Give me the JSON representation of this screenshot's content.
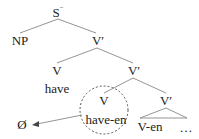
{
  "tree": {
    "root": {
      "label": "S",
      "superscript": "−"
    },
    "np": {
      "label": "NP"
    },
    "vbar1": {
      "label": "V′"
    },
    "v1": {
      "label": "V"
    },
    "vbar2": {
      "label": "V′"
    },
    "have": {
      "label": "have"
    },
    "v2": {
      "label": "V"
    },
    "vbar3": {
      "label": "V′"
    },
    "have_en": {
      "label": "have-en"
    },
    "null": {
      "label": "Ø"
    },
    "v_en": {
      "label": "V-en"
    },
    "ellipsis": {
      "label": "…"
    }
  },
  "colors": {
    "line": "#777777",
    "text": "#222222"
  }
}
